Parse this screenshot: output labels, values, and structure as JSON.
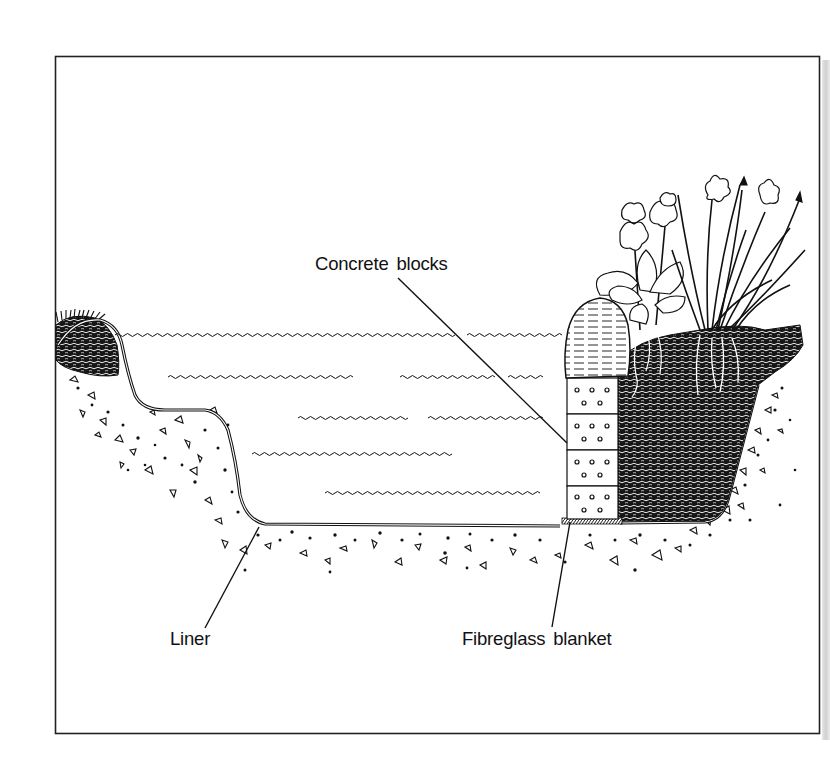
{
  "diagram": {
    "labels": {
      "concrete_blocks": "Concrete blocks",
      "liner": "Liner",
      "fibreglass_blanket": "Fibreglass blanket"
    },
    "components": [
      {
        "name": "frame",
        "kind": "border"
      },
      {
        "name": "left-bank",
        "kind": "soil-with-grass"
      },
      {
        "name": "water",
        "kind": "water-body"
      },
      {
        "name": "liner",
        "kind": "membrane"
      },
      {
        "name": "gravel-subsoil",
        "kind": "aggregate"
      },
      {
        "name": "concrete-block-wall",
        "kind": "blocks",
        "count": 4
      },
      {
        "name": "coping-stone",
        "kind": "stone"
      },
      {
        "name": "fibreglass-blanket",
        "kind": "padding"
      },
      {
        "name": "planting-soil",
        "kind": "soil"
      },
      {
        "name": "marginal-plants",
        "kind": "plants",
        "species_shapes": [
          "primula",
          "iris"
        ]
      }
    ],
    "colors": {
      "ink": "#111111",
      "paper": "#ffffff",
      "shadow": "#d4d4d4"
    }
  }
}
